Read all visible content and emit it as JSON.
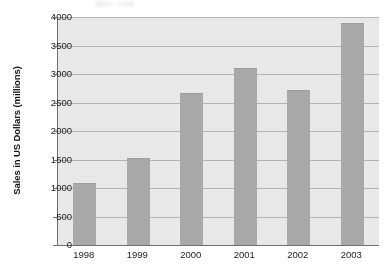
{
  "chart_data": {
    "type": "bar",
    "title": "",
    "xlabel": "",
    "ylabel": "Sales in US Dollars (millions)",
    "categories": [
      "1998",
      "1999",
      "2000",
      "2001",
      "2002",
      "2003"
    ],
    "values": [
      1090,
      1520,
      2670,
      3100,
      2720,
      3890
    ],
    "series": [
      {
        "name": "Sales",
        "values": [
          1090,
          1520,
          2670,
          3100,
          2720,
          3890
        ]
      }
    ],
    "ylim": [
      0,
      4000
    ],
    "y_ticks": [
      0,
      500,
      1000,
      1500,
      2000,
      2500,
      3000,
      3500,
      4000
    ],
    "y_tick_labels": [
      "0",
      "500",
      "1000",
      "1500",
      "2000",
      "2500",
      "3000",
      "3500",
      "4000"
    ],
    "x_tick_labels": [
      "1998",
      "1999",
      "2000",
      "2001",
      "2002",
      "2003"
    ],
    "grid": "horizontal",
    "legend": "none",
    "colors": {
      "bar": "#a9a9a9",
      "plot_background": "#e9e9e9",
      "gridline": "#b4b4b4",
      "axis_line": "#6f6f6f",
      "text": "#1c1c1c",
      "page_background": "#ffffff"
    }
  }
}
